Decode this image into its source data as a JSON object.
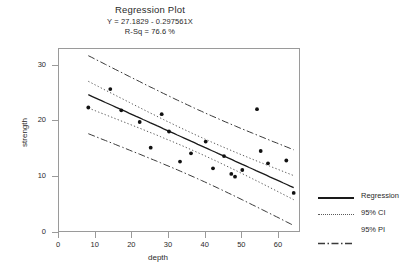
{
  "header": {
    "title": "Regression Plot",
    "equation": "Y = 27.1829 - 0.297561X",
    "rsq": "R-Sq = 76.6 %"
  },
  "legend": {
    "items": [
      {
        "label": "Regression",
        "style": "solid",
        "key": "regression-line-key"
      },
      {
        "label": "95% CI",
        "style": "dotted",
        "key": "ci-band-key"
      },
      {
        "label": "95% PI",
        "style": "dashdot",
        "key": "pi-band-key"
      }
    ]
  },
  "chart_data": {
    "type": "scatter",
    "title": "Regression Plot",
    "xlabel": "depth",
    "ylabel": "strength",
    "xlim": [
      0,
      66
    ],
    "ylim": [
      0,
      33
    ],
    "xticks": [
      0,
      10,
      20,
      30,
      40,
      50,
      60
    ],
    "yticks": [
      0,
      10,
      20,
      30
    ],
    "grid": false,
    "legend_position": "right",
    "annotations": [
      "Y = 27.1829 - 0.297561X",
      "R-Sq = 76.6 %"
    ],
    "fit": {
      "intercept": 27.1829,
      "slope": -0.297561,
      "r_squared": 76.6
    },
    "points": [
      {
        "x": 8,
        "y": 22.5
      },
      {
        "x": 14,
        "y": 25.8
      },
      {
        "x": 17,
        "y": 22.0
      },
      {
        "x": 22,
        "y": 19.9
      },
      {
        "x": 25,
        "y": 15.3
      },
      {
        "x": 28,
        "y": 21.3
      },
      {
        "x": 30,
        "y": 18.2
      },
      {
        "x": 33,
        "y": 12.8
      },
      {
        "x": 36,
        "y": 14.3
      },
      {
        "x": 40,
        "y": 16.4
      },
      {
        "x": 42,
        "y": 11.6
      },
      {
        "x": 45,
        "y": 13.8
      },
      {
        "x": 47,
        "y": 10.6
      },
      {
        "x": 48,
        "y": 10.1
      },
      {
        "x": 50,
        "y": 11.3
      },
      {
        "x": 54,
        "y": 22.2
      },
      {
        "x": 55,
        "y": 14.7
      },
      {
        "x": 57,
        "y": 12.5
      },
      {
        "x": 62,
        "y": 13.0
      },
      {
        "x": 64,
        "y": 7.2
      }
    ],
    "bands": {
      "ci_half_width_at_min": 2.4,
      "ci_half_width_at_center": 1.5,
      "pi_half_width_at_min": 7.0,
      "pi_half_width_at_center": 6.2
    }
  }
}
